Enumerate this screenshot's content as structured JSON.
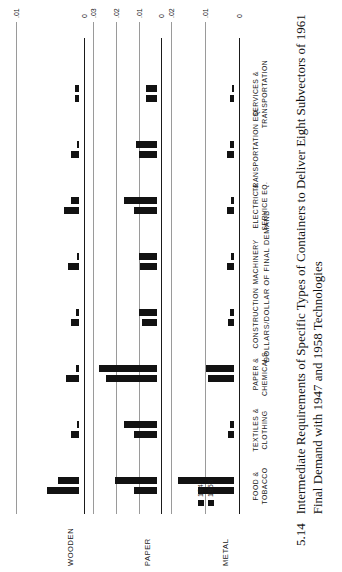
{
  "figure": {
    "number": "5.14",
    "caption": "Intermediate Requirements of Specific Types of Containers to Deliver Eight Subvectors of 1961 Final Demand with 1947 and 1958 Technologies",
    "axis_title": "DOLLARS/DOLLAR OF FINAL DEMAND"
  },
  "legend": {
    "items": [
      {
        "label": "1947",
        "color": "#121212"
      },
      {
        "label": "1958",
        "color": "#121212"
      }
    ]
  },
  "chart_data": {
    "type": "bar",
    "title": "Intermediate Requirements of Specific Types of Containers to Deliver Eight Subvectors of 1961 Final Demand with 1947 and 1958 Technologies",
    "xlabel": "",
    "ylabel": "DOLLARS/DOLLAR OF FINAL DEMAND",
    "grid": true,
    "legend_position": "inside-top-left",
    "categories": [
      "FOOD & TOBACCO",
      "TEXTILES & CLOTHING",
      "PAPER & CHEMICALS",
      "CONSTRUCTION",
      "MACHINERY",
      "ELECTRIC & SERVICE EQ.",
      "TRANSPORTATION EQ.",
      "SERVICES & TRANSPORTATION"
    ],
    "panels": [
      {
        "name": "WOODEN",
        "ylim": [
          0,
          0.01
        ],
        "yticks": [
          0,
          0.01
        ],
        "ytick_labels": [
          "0",
          ".01"
        ],
        "series": [
          {
            "name": "1947",
            "values": [
              0.0048,
              0.0013,
              0.002,
              0.0012,
              0.0017,
              0.0023,
              0.0013,
              0.0007
            ]
          },
          {
            "name": "1958",
            "values": [
              0.0032,
              0.0004,
              0.0005,
              0.0005,
              0.0003,
              0.0013,
              0.0003,
              0.0006
            ]
          }
        ]
      },
      {
        "name": "PAPER",
        "ylim": [
          0,
          0.03
        ],
        "yticks": [
          0,
          0.01,
          0.02,
          0.03
        ],
        "ytick_labels": [
          "0",
          ".01",
          ".02",
          ".03"
        ],
        "series": [
          {
            "name": "1947",
            "values": [
              0.01,
              0.0098,
              0.0222,
              0.0063,
              0.0073,
              0.0098,
              0.0078,
              0.0048
            ]
          },
          {
            "name": "1958",
            "values": [
              0.0184,
              0.0142,
              0.0256,
              0.0079,
              0.008,
              0.0143,
              0.0089,
              0.0048
            ]
          }
        ]
      },
      {
        "name": "METAL",
        "ylim": [
          0,
          0.02
        ],
        "yticks": [
          0,
          0.01,
          0.02
        ],
        "ytick_labels": [
          "0",
          ".01",
          ".02"
        ],
        "series": [
          {
            "name": "1947",
            "values": [
              0.0105,
              0.0018,
              0.0076,
              0.0019,
              0.0021,
              0.002,
              0.002,
              0.0013
            ]
          },
          {
            "name": "1958",
            "values": [
              0.0166,
              0.0011,
              0.0081,
              0.0013,
              0.001,
              0.001,
              0.0012,
              0.0005
            ]
          }
        ]
      }
    ]
  }
}
